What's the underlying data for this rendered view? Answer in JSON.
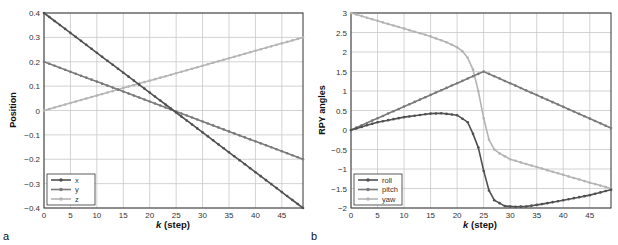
{
  "chart_data": [
    {
      "panel": "a",
      "type": "line",
      "title": "",
      "xlabel": "k (step)",
      "ylabel": "Position",
      "xlim": [
        0,
        49
      ],
      "ylim": [
        -0.4,
        0.4
      ],
      "xticks": [
        0,
        5,
        10,
        15,
        20,
        25,
        30,
        35,
        40,
        45
      ],
      "yticks": [
        0.4,
        0.3,
        0.2,
        0.1,
        0,
        -0.1,
        -0.2,
        -0.3,
        -0.4
      ],
      "grid": true,
      "legend_position": "lower left",
      "series": [
        {
          "name": "x",
          "color": "#505050",
          "k": [
            0,
            49
          ],
          "values": [
            0.4,
            -0.4
          ]
        },
        {
          "name": "y",
          "color": "#7a7a7a",
          "k": [
            0,
            49
          ],
          "values": [
            0.2,
            -0.2
          ]
        },
        {
          "name": "z",
          "color": "#b4b4b4",
          "k": [
            0,
            49
          ],
          "values": [
            0.0,
            0.3
          ]
        }
      ]
    },
    {
      "panel": "b",
      "type": "line",
      "title": "",
      "xlabel": "k (step)",
      "ylabel": "RPY angles",
      "xlim": [
        0,
        49
      ],
      "ylim": [
        -2,
        3
      ],
      "xticks": [
        0,
        5,
        10,
        15,
        20,
        25,
        30,
        35,
        40,
        45
      ],
      "yticks": [
        3,
        2.5,
        2,
        1.5,
        1,
        0.5,
        0,
        -0.5,
        -1,
        -1.5,
        -2
      ],
      "grid": true,
      "legend_position": "lower left",
      "series": [
        {
          "name": "roll",
          "color": "#505050",
          "k": [
            0,
            5,
            10,
            15,
            17,
            20,
            22,
            23,
            24,
            25,
            26,
            27,
            29,
            31,
            33,
            36,
            40,
            45,
            49
          ],
          "values": [
            0,
            0.2,
            0.33,
            0.42,
            0.43,
            0.38,
            0.2,
            -0.1,
            -0.45,
            -1.05,
            -1.55,
            -1.8,
            -1.95,
            -1.97,
            -1.96,
            -1.9,
            -1.8,
            -1.67,
            -1.53
          ]
        },
        {
          "name": "pitch",
          "color": "#7a7a7a",
          "k": [
            0,
            25,
            49
          ],
          "values": [
            0,
            1.5,
            0.05
          ]
        },
        {
          "name": "yaw",
          "color": "#b4b4b4",
          "k": [
            0,
            5,
            10,
            15,
            18,
            20,
            21,
            22,
            23,
            24,
            25,
            26,
            27,
            28,
            30,
            35,
            40,
            45,
            49
          ],
          "values": [
            3.0,
            2.8,
            2.6,
            2.4,
            2.25,
            2.12,
            2.02,
            1.85,
            1.55,
            1.0,
            0.3,
            -0.25,
            -0.5,
            -0.6,
            -0.75,
            -0.95,
            -1.15,
            -1.35,
            -1.5
          ]
        }
      ]
    }
  ],
  "labels": {
    "panel_a": "a",
    "panel_b": "b",
    "xlabel_a_k": "k",
    "xlabel_a_rest": " (step)",
    "xlabel_b_k": "k",
    "xlabel_b_rest": " (step)",
    "ylabel_a": "Position",
    "ylabel_b": "RPY angles"
  }
}
